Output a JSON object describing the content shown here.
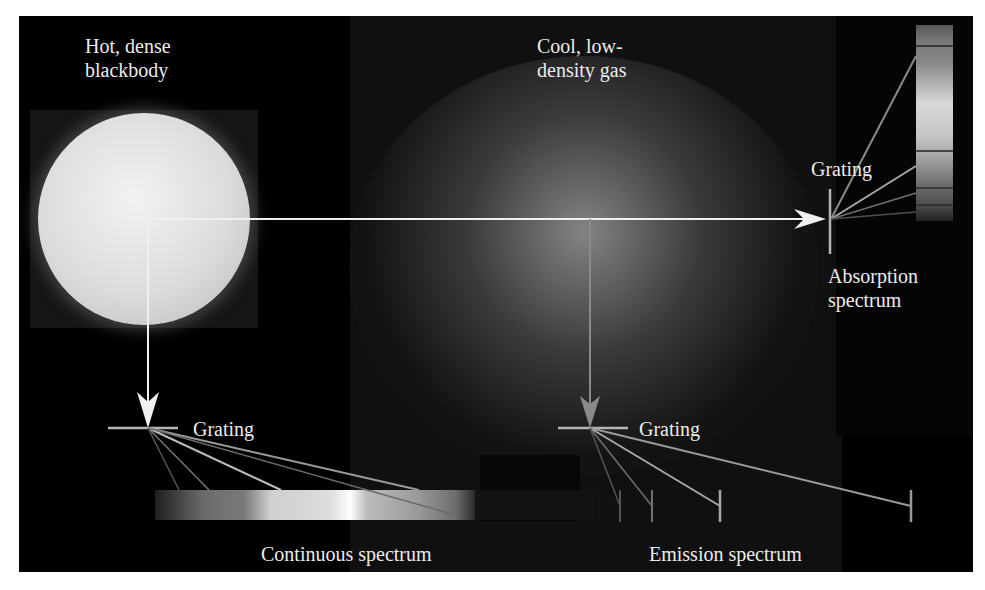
{
  "diagram": {
    "type": "spectra-formation",
    "labels": {
      "source_blackbody": [
        "Hot, dense",
        "blackbody"
      ],
      "source_gas": [
        "Cool, low-",
        "density gas"
      ],
      "grating_absorption": "Grating",
      "grating_continuous": "Grating",
      "grating_emission": "Grating",
      "absorption_spectrum": [
        "Absorption",
        "spectrum"
      ],
      "continuous_spectrum": "Continuous spectrum",
      "emission_spectrum": "Emission spectrum"
    },
    "colors": {
      "background": "#000000",
      "gas_panel": "#111111",
      "arrow_light": "#f0f0f0",
      "arrow_grey": "#8a8a8a",
      "grating": "#b5b5b5",
      "rays": "#9a9a9a",
      "text": "#ececec"
    },
    "absorption_lines_y": [
      46,
      151,
      188,
      205
    ],
    "emission_lines_x": [
      620,
      652,
      720,
      911
    ]
  }
}
